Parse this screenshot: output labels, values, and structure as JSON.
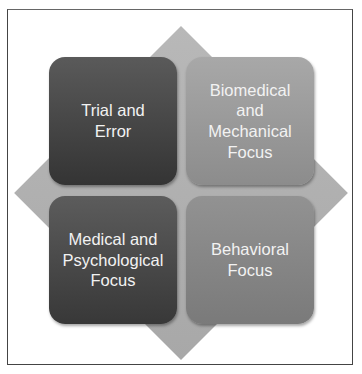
{
  "diagram": {
    "type": "matrix-2x2-on-diamond",
    "quadrants": [
      {
        "position": "top-left",
        "label": "Trial and\nError",
        "fill": "#474747"
      },
      {
        "position": "top-right",
        "label": "Biomedical\nand\nMechanical\nFocus",
        "fill": "#9a9a9a"
      },
      {
        "position": "bottom-left",
        "label": "Medical and\nPsychological\nFocus",
        "fill": "#4a4a4a"
      },
      {
        "position": "bottom-right",
        "label": "Behavioral\nFocus",
        "fill": "#868686"
      }
    ],
    "background_shape": {
      "shape": "diamond",
      "fill": "#b0b0b0"
    }
  }
}
